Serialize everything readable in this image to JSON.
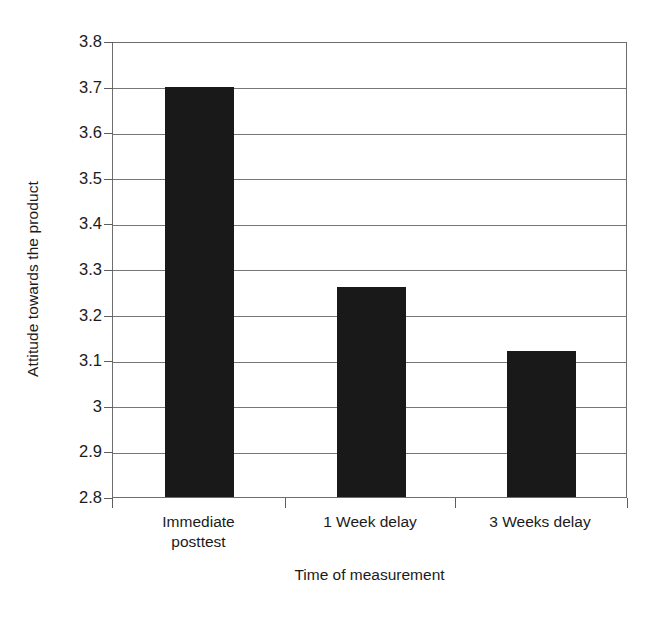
{
  "chart_data": {
    "type": "bar",
    "title": "",
    "xlabel": "Time of measurement",
    "ylabel": "Attitude towards the product",
    "categories": [
      "Immediate posttest",
      "1 Week delay",
      "3 Weeks delay"
    ],
    "category_lines": [
      [
        "Immediate",
        "posttest"
      ],
      [
        "1 Week delay"
      ],
      [
        "3 Weeks delay"
      ]
    ],
    "values": [
      3.7,
      3.26,
      3.12
    ],
    "ylim": [
      2.8,
      3.8
    ],
    "ytick_labels": [
      "3.8",
      "3.7",
      "3.6",
      "3.5",
      "3.4",
      "3.3",
      "3.2",
      "3.1",
      "3",
      "2.9",
      "2.8"
    ],
    "ytick_values": [
      3.8,
      3.7,
      3.6,
      3.5,
      3.4,
      3.3,
      3.2,
      3.1,
      3.0,
      2.9,
      2.8
    ],
    "grid": true,
    "grid_axis": "y",
    "legend": false,
    "legend_position": "none",
    "bar_color": "#191919",
    "grid_color": "#77777a",
    "axis_color": "#6d6d6d",
    "background_color": "#ffffff",
    "text_color": "#1b1b1b"
  }
}
